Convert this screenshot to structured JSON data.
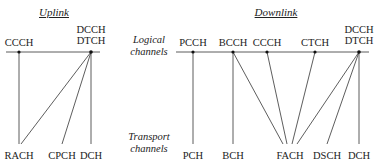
{
  "uplink": {
    "title": "Uplink",
    "logical": [
      {
        "id": "ul_ccch",
        "label": "CCCH",
        "x": 19
      },
      {
        "id": "ul_dcch",
        "label": "DCCH\nDTCH",
        "line1": "DCCH",
        "line2": "DTCH",
        "x": 91
      }
    ],
    "transport": [
      {
        "id": "ul_rach",
        "label": "RACH",
        "x": 19
      },
      {
        "id": "ul_cpch",
        "label": "CPCH",
        "x": 62
      },
      {
        "id": "ul_dch",
        "label": "DCH",
        "x": 91
      }
    ],
    "mappings": [
      [
        "ul_ccch",
        "ul_rach"
      ],
      [
        "ul_dcch",
        "ul_rach"
      ],
      [
        "ul_dcch",
        "ul_cpch"
      ],
      [
        "ul_dcch",
        "ul_dch"
      ]
    ]
  },
  "side_labels": {
    "logical_line1": "Logical",
    "logical_line2": "channels",
    "transport_line1": "Transport",
    "transport_line2": "channels"
  },
  "downlink": {
    "title": "Downlink",
    "logical": [
      {
        "id": "dl_pcch",
        "label": "PCCH",
        "x": 193
      },
      {
        "id": "dl_bcch",
        "label": "BCCH",
        "x": 233
      },
      {
        "id": "dl_ccch",
        "label": "CCCH",
        "x": 267
      },
      {
        "id": "dl_ctch",
        "label": "CTCH",
        "x": 315
      },
      {
        "id": "dl_dcch",
        "label": "DCCH\nDTCH",
        "line1": "DCCH",
        "line2": "DTCH",
        "x": 359
      }
    ],
    "transport": [
      {
        "id": "dl_pch",
        "label": "PCH",
        "x": 193
      },
      {
        "id": "dl_bch",
        "label": "BCH",
        "x": 233
      },
      {
        "id": "dl_fach",
        "label": "FACH",
        "x": 290
      },
      {
        "id": "dl_dsch",
        "label": "DSCH",
        "x": 327
      },
      {
        "id": "dl_dch",
        "label": "DCH",
        "x": 359
      }
    ],
    "mappings": [
      [
        "dl_pcch",
        "dl_pch"
      ],
      [
        "dl_bcch",
        "dl_bch"
      ],
      [
        "dl_bcch",
        "dl_fach"
      ],
      [
        "dl_ccch",
        "dl_fach"
      ],
      [
        "dl_ctch",
        "dl_fach"
      ],
      [
        "dl_dcch",
        "dl_fach"
      ],
      [
        "dl_dcch",
        "dl_dsch"
      ],
      [
        "dl_dcch",
        "dl_dch"
      ]
    ]
  }
}
